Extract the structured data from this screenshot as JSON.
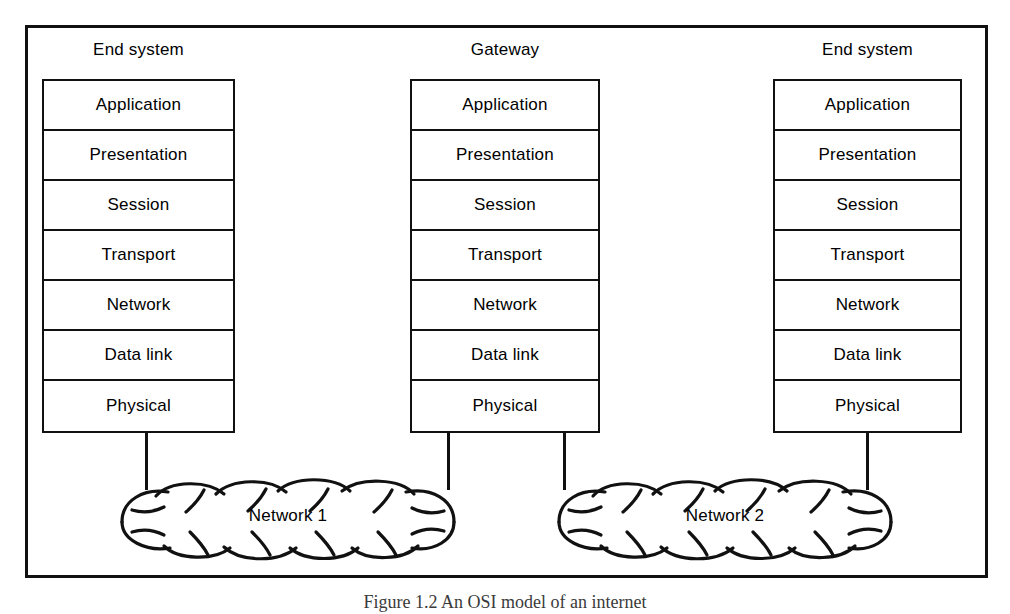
{
  "figure": {
    "caption": "Figure 1.2   An OSI model of an internet",
    "layers": [
      "Application",
      "Presentation",
      "Session",
      "Transport",
      "Network",
      "Data link",
      "Physical"
    ],
    "stacks": [
      {
        "id": "left",
        "title": "End system",
        "layers": [
          "Application",
          "Presentation",
          "Session",
          "Transport",
          "Network",
          "Data link",
          "Physical"
        ]
      },
      {
        "id": "middle",
        "title": "Gateway",
        "layers": [
          "Application",
          "Presentation",
          "Session",
          "Transport",
          "Network",
          "Data link",
          "Physical"
        ]
      },
      {
        "id": "right",
        "title": "End system",
        "layers": [
          "Application",
          "Presentation",
          "Session",
          "Transport",
          "Network",
          "Data link",
          "Physical"
        ]
      }
    ],
    "clouds": [
      {
        "id": "network-1",
        "label": "Network 1"
      },
      {
        "id": "network-2",
        "label": "Network 2"
      }
    ],
    "colors": {
      "ink": "#111111",
      "paper": "#ffffff",
      "caption_ink": "#3a3a3a"
    }
  }
}
